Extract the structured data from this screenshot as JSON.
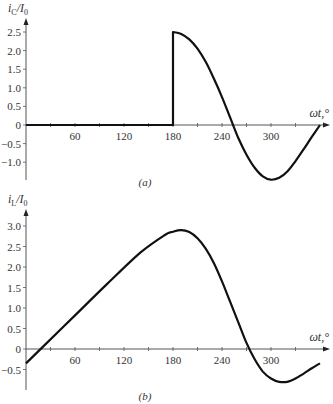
{
  "chart_data": [
    {
      "id": "a",
      "type": "line",
      "caption": "(a)",
      "title": "",
      "ylabel": "i_C/I_0",
      "ylabel_main": "i",
      "ylabel_sub": "C",
      "ylabel_den": "/I",
      "ylabel_den_sub": "0",
      "xlabel": "ωt,°",
      "xlim": [
        0,
        360
      ],
      "ylim": [
        -1.5,
        2.7
      ],
      "xticks": [
        60,
        120,
        180,
        240,
        300
      ],
      "xtick_labels": [
        "60",
        "120",
        "180",
        "240",
        "300"
      ],
      "yticks": [
        2.5,
        2.0,
        1.5,
        1.0,
        0.5,
        0,
        -0.5,
        -1.0
      ],
      "ytick_labels": [
        "2.5",
        "2.0",
        "1.5",
        "1.0",
        "0.5",
        "0",
        "−0.5",
        "−1.0"
      ],
      "grid": false,
      "series": [
        {
          "name": "i_C/I_0",
          "x": [
            0,
            180,
            180,
            190,
            200,
            210,
            220,
            230,
            240,
            250,
            260,
            270,
            280,
            290,
            300,
            310,
            320,
            330,
            340,
            350,
            360
          ],
          "values": [
            0,
            0,
            2.5,
            2.45,
            2.3,
            2.05,
            1.7,
            1.25,
            0.75,
            0.2,
            -0.35,
            -0.8,
            -1.15,
            -1.38,
            -1.47,
            -1.42,
            -1.25,
            -0.97,
            -0.65,
            -0.32,
            0
          ]
        }
      ]
    },
    {
      "id": "b",
      "type": "line",
      "caption": "(b)",
      "title": "",
      "ylabel": "i_L/I_0",
      "ylabel_main": "i",
      "ylabel_sub": "L",
      "ylabel_den": "/I",
      "ylabel_den_sub": "0",
      "xlabel": "ωt,°",
      "xlim": [
        0,
        360
      ],
      "ylim": [
        -1.0,
        3.2
      ],
      "xticks": [
        60,
        120,
        180,
        240,
        300
      ],
      "xtick_labels": [
        "60",
        "120",
        "180",
        "240",
        "300"
      ],
      "yticks": [
        3.0,
        2.5,
        2.0,
        1.5,
        1.0,
        0.5,
        0,
        -0.5
      ],
      "ytick_labels": [
        "3.0",
        "2.5",
        "2.0",
        "1.5",
        "1.0",
        "0.5",
        "0",
        "−0.5"
      ],
      "grid": false,
      "series": [
        {
          "name": "i_L/I_0",
          "x": [
            0,
            20,
            60,
            100,
            140,
            170,
            180,
            190,
            200,
            210,
            220,
            230,
            240,
            250,
            260,
            270,
            280,
            290,
            300,
            310,
            320,
            330,
            340,
            350,
            360
          ],
          "values": [
            -0.35,
            0.04,
            0.82,
            1.6,
            2.35,
            2.78,
            2.86,
            2.9,
            2.85,
            2.7,
            2.45,
            2.1,
            1.65,
            1.15,
            0.65,
            0.15,
            -0.25,
            -0.55,
            -0.72,
            -0.8,
            -0.8,
            -0.72,
            -0.6,
            -0.47,
            -0.35
          ]
        }
      ]
    }
  ]
}
